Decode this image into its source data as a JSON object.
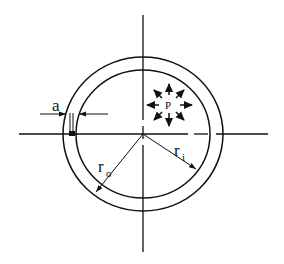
{
  "diagram": {
    "colors": {
      "line": "#111111",
      "background": "#ffffff"
    },
    "center": {
      "x": 143,
      "y": 134
    },
    "outer_radius_px": 77,
    "inner_radius_px": 64,
    "labels": {
      "crack_depth": "a",
      "pressure": "P",
      "outer_radius": "r",
      "outer_radius_sub": "o",
      "inner_radius": "r",
      "inner_radius_sub": "i"
    },
    "pressure_arrows": 8
  }
}
